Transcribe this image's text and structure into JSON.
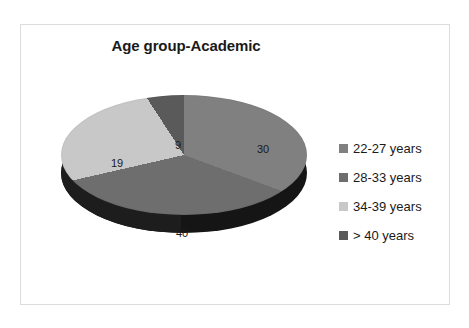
{
  "chart": {
    "title": "Age group-Academic",
    "frame_border_color": "#dcdcdc",
    "background_color": "#ffffff",
    "text_color": "#1a1a1a",
    "side_wall_color": "#151515"
  },
  "legend": {
    "position": "right",
    "items": [
      {
        "label": "22-27 years",
        "swatch_color": "#808080",
        "icon": "legend-square-icon"
      },
      {
        "label": "28-33 years",
        "swatch_color": "#6e6e6e",
        "icon": "legend-square-icon"
      },
      {
        "label": "34-39 years",
        "swatch_color": "#c8c8c8",
        "icon": "legend-square-icon"
      },
      {
        "label": "> 40 years",
        "swatch_color": "#5a5a5a",
        "icon": "legend-square-icon"
      }
    ]
  },
  "labels": {
    "slice_30": "30",
    "slice_40": "40",
    "slice_19": "19",
    "slice_9": "9"
  },
  "chart_data": {
    "type": "pie",
    "title": "Age group-Academic",
    "subtitle": "",
    "xlabel": "",
    "ylabel": "",
    "grid": false,
    "legend_position": "right",
    "three_d": true,
    "total": 98,
    "categories": [
      "22-27 years",
      "28-33 years",
      "34-39 years",
      "> 40 years"
    ],
    "values": [
      30,
      40,
      19,
      9
    ],
    "data_labels": [
      "30",
      "40",
      "19",
      "9"
    ],
    "colors": [
      "#808080",
      "#6e6e6e",
      "#c8c8c8",
      "#5a5a5a"
    ],
    "slices": [
      {
        "name": "22-27 years",
        "value": 30,
        "label": "30",
        "percent": 30.6,
        "color": "#808080"
      },
      {
        "name": "28-33 years",
        "value": 40,
        "label": "40",
        "percent": 40.8,
        "color": "#6e6e6e"
      },
      {
        "name": "34-39 years",
        "value": 19,
        "label": "19",
        "percent": 19.4,
        "color": "#c8c8c8"
      },
      {
        "name": "> 40 years",
        "value": 9,
        "label": "9",
        "percent": 9.2,
        "color": "#5a5a5a"
      }
    ]
  }
}
